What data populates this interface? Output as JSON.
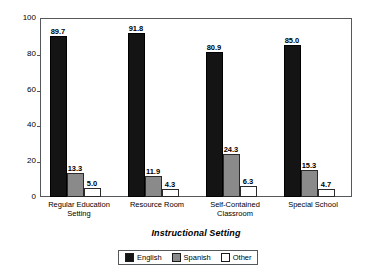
{
  "chart_data": {
    "type": "bar",
    "title": "",
    "xlabel": "Instructional Setting",
    "ylabel": "Percentage within Setting",
    "ylim": [
      0,
      100
    ],
    "yticks": [
      0,
      20,
      40,
      60,
      80,
      100
    ],
    "grid": false,
    "legend_position": "bottom",
    "categories": [
      "Regular Education Setting",
      "Resource Room",
      "Self-Contained Classroom",
      "Special School"
    ],
    "category_lines": [
      [
        "Regular Education",
        "Setting"
      ],
      [
        "Resource Room"
      ],
      [
        "Self-Contained",
        "Classroom"
      ],
      [
        "Special School"
      ]
    ],
    "series": [
      {
        "name": "English",
        "color": "#141414",
        "values": [
          89.7,
          91.8,
          80.9,
          85.0
        ],
        "labels": [
          "89.7",
          "91.8",
          "80.9",
          "85.0"
        ]
      },
      {
        "name": "Spanish",
        "color": "#8a8a8a",
        "values": [
          13.3,
          11.9,
          24.3,
          15.3
        ],
        "labels": [
          "13.3",
          "11.9",
          "24.3",
          "15.3"
        ]
      },
      {
        "name": "Other",
        "color": "#ffffff",
        "values": [
          5.0,
          4.3,
          6.3,
          4.7
        ],
        "labels": [
          "5.0",
          "4.3",
          "6.3",
          "4.7"
        ]
      }
    ]
  },
  "axis": {
    "y_tick_labels": [
      "100",
      "80",
      "60",
      "40",
      "20",
      "0"
    ],
    "y_title": "Percentage within Setting",
    "x_title": "Instructional Setting"
  },
  "legend": {
    "items": [
      {
        "label": "English",
        "swatch": "english"
      },
      {
        "label": "Spanish",
        "swatch": "spanish"
      },
      {
        "label": "Other",
        "swatch": "other"
      }
    ]
  }
}
